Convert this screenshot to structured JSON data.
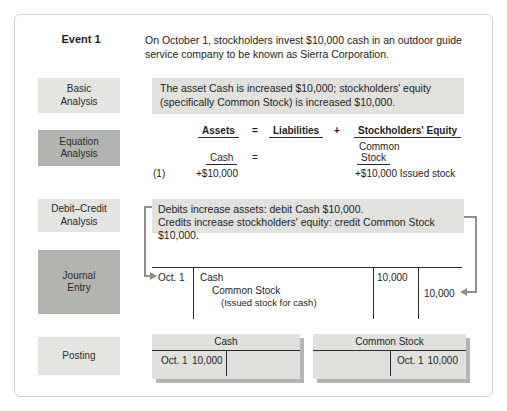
{
  "event": {
    "label": "Event 1",
    "description": "On October 1, stockholders invest $10,000 cash in an outdoor guide service company to be known as Sierra Corporation."
  },
  "basic_analysis": {
    "label": "Basic Analysis",
    "text": "The asset Cash is increased $10,000; stockholders' equity (specifically Common Stock) is increased $10,000."
  },
  "equation_analysis": {
    "label": "Equation Analysis",
    "headers": {
      "assets": "Assets",
      "equals": "=",
      "liabilities": "Liabilities",
      "plus": "+",
      "equity": "Stockholders' Equity"
    },
    "sub": {
      "cash": "Cash",
      "equals": "=",
      "common": "Common",
      "stock": "Stock"
    },
    "row": {
      "ref": "(1)",
      "assets_value": "+$10,000",
      "equity_value": "+$10,000 Issued stock"
    }
  },
  "debit_credit_analysis": {
    "label": "Debit–Credit Analysis",
    "line1": "Debits increase assets: debit Cash $10,000.",
    "line2": "Credits increase stockholders' equity: credit Common Stock $10,000."
  },
  "journal_entry": {
    "label": "Journal Entry",
    "date": "Oct. 1",
    "debit_account": "Cash",
    "credit_account": "Common Stock",
    "memo": "(Issued stock for cash)",
    "debit_amount": "10,000",
    "credit_amount": "10,000"
  },
  "posting": {
    "label": "Posting",
    "accounts": [
      {
        "title": "Cash",
        "side": "debit",
        "date": "Oct. 1",
        "amount": "10,000"
      },
      {
        "title": "Common Stock",
        "side": "credit",
        "date": "Oct. 1",
        "amount": "10,000"
      }
    ]
  },
  "colors": {
    "label_light": "#e4e4e1",
    "label_medium": "#b2b4af",
    "highlight": "#e1e1de",
    "arrow": "#8f908c",
    "line": "#2b2b2b"
  }
}
